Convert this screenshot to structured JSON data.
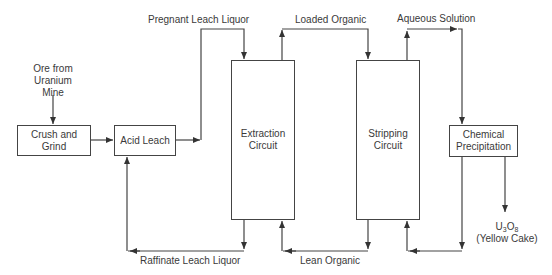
{
  "diagram": {
    "type": "process-flow",
    "title": "",
    "nodes": {
      "ore_source": {
        "line1": "Ore from",
        "line2": "Uranium",
        "line3": "Mine"
      },
      "crush_grind": {
        "label": "Crush and Grind"
      },
      "acid_leach": {
        "label": "Acid Leach"
      },
      "extraction": {
        "line1": "Extraction",
        "line2": "Circuit"
      },
      "stripping": {
        "line1": "Stripping",
        "line2": "Circuit"
      },
      "precipitation": {
        "line1": "Chemical",
        "line2": "Precipitation"
      },
      "product": {
        "u": "U",
        "u_sub": "3",
        "o": "O",
        "o_sub": "8",
        "line2": "(Yellow Cake)"
      }
    },
    "flows": {
      "pregnant_leach_liquor": "Pregnant Leach Liquor",
      "loaded_organic": "Loaded Organic",
      "aqueous_solution": "Aqueous Solution",
      "raffinate_leach_liquor": "Raffinate Leach Liquor",
      "lean_organic": "Lean Organic"
    },
    "edges": [
      {
        "from": "Ore from Uranium Mine",
        "to": "Crush and Grind"
      },
      {
        "from": "Crush and Grind",
        "to": "Acid Leach"
      },
      {
        "from": "Acid Leach",
        "to": "Extraction Circuit",
        "label": "Pregnant Leach Liquor"
      },
      {
        "from": "Extraction Circuit",
        "to": "Stripping Circuit",
        "label": "Loaded Organic"
      },
      {
        "from": "Stripping Circuit",
        "to": "Chemical Precipitation",
        "label": "Aqueous Solution"
      },
      {
        "from": "Extraction Circuit",
        "to": "Acid Leach",
        "label": "Raffinate Leach Liquor"
      },
      {
        "from": "Stripping Circuit",
        "to": "Extraction Circuit",
        "label": "Lean Organic"
      },
      {
        "from": "Chemical Precipitation",
        "to": "Stripping Circuit"
      },
      {
        "from": "Chemical Precipitation",
        "to": "U3O8 (Yellow Cake)"
      }
    ]
  }
}
